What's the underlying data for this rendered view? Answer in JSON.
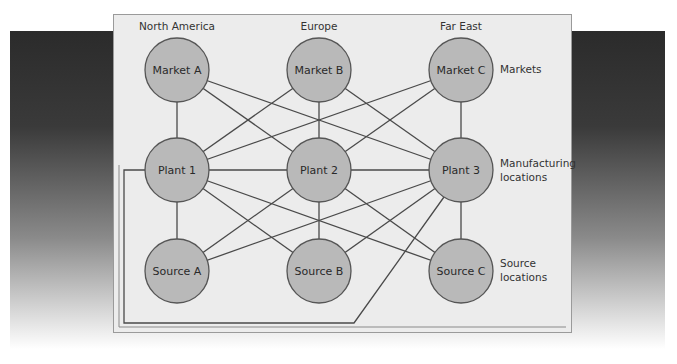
{
  "diagram": {
    "type": "supply-chain-network",
    "colors": {
      "node_fill": "#b9b9b9",
      "node_stroke": "#555555",
      "edge": "#4a4a4a",
      "panel": "#ececec",
      "backdrop_top": "#2b2b2b"
    },
    "regions": [
      {
        "label": "North America"
      },
      {
        "label": "Europe"
      },
      {
        "label": "Far East"
      }
    ],
    "tiers": [
      {
        "label_lines": [
          "Markets"
        ]
      },
      {
        "label_lines": [
          "Manufacturing",
          "locations"
        ]
      },
      {
        "label_lines": [
          "Source",
          "locations"
        ]
      }
    ],
    "nodes": {
      "markets": [
        {
          "id": "MA",
          "label": "Market A"
        },
        {
          "id": "MB",
          "label": "Market B"
        },
        {
          "id": "MC",
          "label": "Market C"
        }
      ],
      "plants": [
        {
          "id": "P1",
          "label": "Plant 1"
        },
        {
          "id": "P2",
          "label": "Plant 2"
        },
        {
          "id": "P3",
          "label": "Plant 3"
        }
      ],
      "sources": [
        {
          "id": "SA",
          "label": "Source A"
        },
        {
          "id": "SB",
          "label": "Source B"
        },
        {
          "id": "SC",
          "label": "Source C"
        }
      ]
    },
    "edges": [
      [
        "MA",
        "P1"
      ],
      [
        "MA",
        "P2"
      ],
      [
        "MA",
        "P3"
      ],
      [
        "MB",
        "P1"
      ],
      [
        "MB",
        "P2"
      ],
      [
        "MB",
        "P3"
      ],
      [
        "MC",
        "P1"
      ],
      [
        "MC",
        "P2"
      ],
      [
        "MC",
        "P3"
      ],
      [
        "P1",
        "P2"
      ],
      [
        "P2",
        "P3"
      ],
      [
        "P1",
        "P3"
      ],
      [
        "P1",
        "SA"
      ],
      [
        "P1",
        "SB"
      ],
      [
        "P1",
        "SC"
      ],
      [
        "P2",
        "SA"
      ],
      [
        "P2",
        "SB"
      ],
      [
        "P2",
        "SC"
      ],
      [
        "P3",
        "SA"
      ],
      [
        "P3",
        "SB"
      ],
      [
        "P3",
        "SC"
      ]
    ]
  }
}
